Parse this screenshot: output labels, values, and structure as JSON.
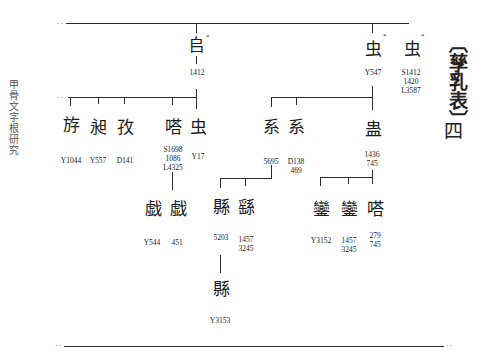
{
  "page": {
    "side_title": "甲骨文字根研究",
    "title": "〔孳乳表〕",
    "page_number": "四"
  },
  "tree": {
    "root_row": [
      {
        "id": "n1412",
        "glyph": "𠂤",
        "star": "*",
        "labels": "1412"
      },
      {
        "id": "nY547",
        "glyph": "虫",
        "star": "*",
        "labels": "Y547"
      },
      {
        "id": "nS1412",
        "glyph": "虫",
        "star": "*",
        "labels": "S1412\n1420\nL3587"
      }
    ],
    "row2_left": [
      {
        "id": "nY1044",
        "glyph": "斿",
        "labels": "Y1044"
      },
      {
        "id": "nY557",
        "glyph": "昶",
        "labels": "Y557"
      },
      {
        "id": "nD141",
        "glyph": "孜",
        "labels": "D141"
      },
      {
        "id": "nS1698",
        "glyph": "嗒",
        "labels": "S1698\n1086\nL4325"
      },
      {
        "id": "nY17",
        "glyph": "虫",
        "labels": "Y17"
      }
    ],
    "row2_right": [
      {
        "id": "n5695",
        "glyph": "系",
        "labels": "5695"
      },
      {
        "id": "nD138",
        "glyph": "系",
        "labels": "D138\n469"
      },
      {
        "id": "n1436",
        "glyph": "蛊",
        "labels": "1436\n745"
      }
    ],
    "row3": [
      {
        "id": "nY544",
        "glyph": "戯",
        "labels": "Y544"
      },
      {
        "id": "n451",
        "glyph": "戯",
        "labels": "451"
      },
      {
        "id": "n5203",
        "glyph": "縣",
        "labels": "5203"
      },
      {
        "id": "n1457a",
        "glyph": "繇",
        "labels": "1457\n3245"
      },
      {
        "id": "nY3152",
        "glyph": "鑾",
        "labels": "Y3152"
      },
      {
        "id": "n1457b",
        "glyph": "鑾",
        "labels": "1457\n3245"
      },
      {
        "id": "n279",
        "glyph": "嗒",
        "labels": "279\n745"
      }
    ],
    "row4": [
      {
        "id": "nY3153",
        "glyph": "縣",
        "labels": "Y3153"
      }
    ]
  }
}
